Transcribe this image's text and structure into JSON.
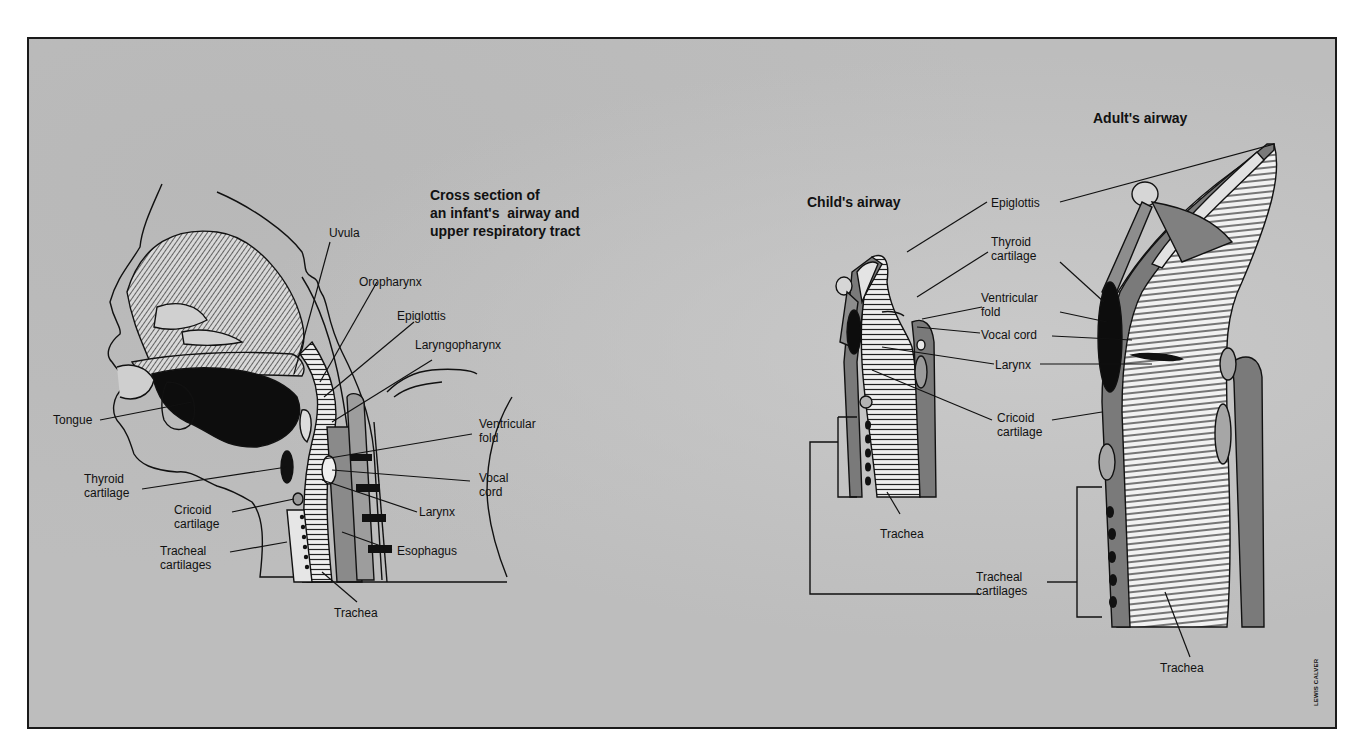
{
  "infant_section": {
    "title": "Cross section of\nan infant's  airway and\nupper respiratory tract",
    "labels": {
      "uvula": "Uvula",
      "oropharynx": "Oropharynx",
      "epiglottis": "Epiglottis",
      "laryngopharynx": "Laryngopharynx",
      "tongue": "Tongue",
      "ventricular_fold": "Ventricular\nfold",
      "thyroid_cartilage": "Thyroid\ncartilage",
      "vocal_cord": "Vocal\ncord",
      "cricoid_cartilage": "Cricoid\ncartilage",
      "larynx": "Larynx",
      "tracheal_cartilages": "Tracheal\ncartilages",
      "esophagus": "Esophagus",
      "trachea": "Trachea"
    }
  },
  "comparison_section": {
    "child_title": "Child's airway",
    "adult_title": "Adult's airway",
    "labels": {
      "epiglottis": "Epiglottis",
      "thyroid_cartilage": "Thyroid\ncartilage",
      "ventricular_fold": "Ventricular\nfold",
      "vocal_cord": "Vocal cord",
      "larynx": "Larynx",
      "cricoid_cartilage": "Cricoid\ncartilage",
      "child_trachea": "Trachea",
      "tracheal_cartilages": "Tracheal\ncartilages",
      "adult_trachea": "Trachea"
    }
  },
  "credit": "LEWIS CALVER",
  "colors": {
    "background": "#bdbdbd",
    "ink": "#111111",
    "mid_gray": "#7a7a7a",
    "light_tissue": "#e8e8e8"
  }
}
